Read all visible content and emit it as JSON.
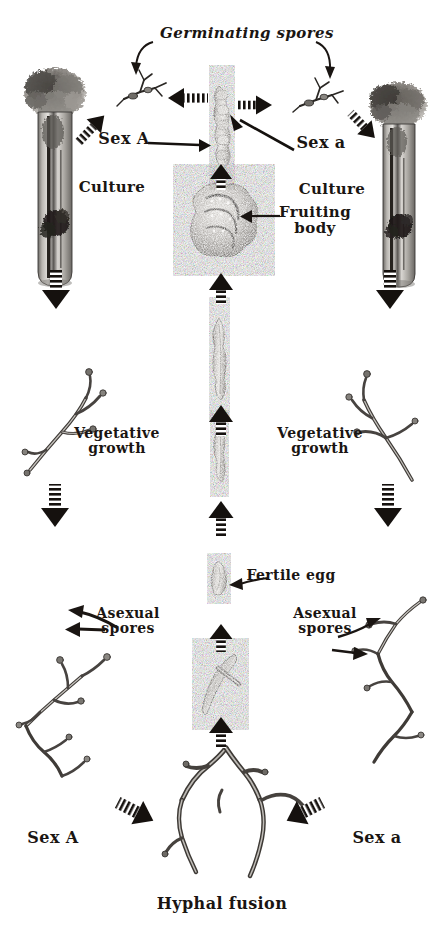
{
  "figure": {
    "background_color": "#ffffff",
    "ink_color": "#1a1512",
    "width": 443,
    "height": 944
  },
  "labels": {
    "germinating_spores": "Germinating spores",
    "sex_a_upper_left": "Sex A",
    "sex_a_upper_right": "Sex a",
    "culture_left": "Culture",
    "culture_right": "Culture",
    "fruiting_body": "Fruiting\nbody",
    "vegetative_growth_left": "Vegetative\ngrowth",
    "vegetative_growth_right": "Vegetative\ngrowth",
    "fertile_egg": "Fertile egg",
    "asexual_spores_left": "Asexual\nspores",
    "asexual_spores_right": "Asexual\nspores",
    "sex_a_lower_left": "Sex A",
    "sex_a_lower_right": "Sex a",
    "hyphal_fusion": "Hyphal fusion"
  },
  "specimens": [
    {
      "name": "culture-tube-left",
      "caption": "Culture"
    },
    {
      "name": "culture-tube-right",
      "caption": "Culture"
    },
    {
      "name": "germinating-spore-left",
      "caption": "Germinating spores"
    },
    {
      "name": "germinating-spore-right",
      "caption": "Germinating spores"
    },
    {
      "name": "spore-chain-center",
      "caption": ""
    },
    {
      "name": "fruiting-body",
      "caption": "Fruiting body"
    },
    {
      "name": "ascus-upper",
      "caption": ""
    },
    {
      "name": "ascus-lower",
      "caption": ""
    },
    {
      "name": "fertile-egg",
      "caption": "Fertile egg"
    },
    {
      "name": "fusing-hypha",
      "caption": ""
    },
    {
      "name": "hyphal-fusion-mycelium",
      "caption": "Hyphal fusion"
    },
    {
      "name": "vegetative-mycelium-left",
      "caption": "Vegetative growth"
    },
    {
      "name": "vegetative-mycelium-right",
      "caption": "Vegetative growth"
    },
    {
      "name": "asexual-spore-mycelium-left",
      "caption": "Asexual spores"
    },
    {
      "name": "asexual-spore-mycelium-right",
      "caption": "Asexual spores"
    }
  ],
  "arrows": [
    {
      "name": "arrow-spore-to-culture-left",
      "style": "striped",
      "direction": "down-left"
    },
    {
      "name": "arrow-chain-to-spore-left",
      "style": "striped",
      "direction": "left"
    },
    {
      "name": "arrow-chain-to-spore-right",
      "style": "striped",
      "direction": "right"
    },
    {
      "name": "arrow-spore-to-culture-right",
      "style": "striped",
      "direction": "down-right"
    },
    {
      "name": "arrow-sexA-to-chain",
      "style": "solid",
      "direction": "right"
    },
    {
      "name": "arrow-sexa-to-chain",
      "style": "solid",
      "direction": "up-left"
    },
    {
      "name": "arrow-fruiting-to-chain",
      "style": "striped",
      "direction": "up"
    },
    {
      "name": "arrow-ascus-to-fruiting",
      "style": "striped",
      "direction": "up"
    },
    {
      "name": "arrow-lower-ascus-to-ascus",
      "style": "striped",
      "direction": "up"
    },
    {
      "name": "arrow-egg-to-ascus",
      "style": "striped",
      "direction": "up"
    },
    {
      "name": "arrow-hypha-to-egg",
      "style": "striped",
      "direction": "up"
    },
    {
      "name": "arrow-fusion-to-hypha",
      "style": "striped",
      "direction": "up"
    },
    {
      "name": "arrow-culture-to-vegetative-left",
      "style": "striped",
      "direction": "down"
    },
    {
      "name": "arrow-culture-to-vegetative-right",
      "style": "striped",
      "direction": "down"
    },
    {
      "name": "arrow-vegetative-to-asexual-left",
      "style": "striped",
      "direction": "down"
    },
    {
      "name": "arrow-vegetative-to-asexual-right",
      "style": "striped",
      "direction": "down"
    },
    {
      "name": "arrow-sexA-to-fusion",
      "style": "striped",
      "direction": "down-right"
    },
    {
      "name": "arrow-sexa-to-fusion",
      "style": "striped",
      "direction": "down-left"
    },
    {
      "name": "leader-germinating-left",
      "style": "curve",
      "direction": "down-left"
    },
    {
      "name": "leader-germinating-right",
      "style": "curve",
      "direction": "down-right"
    },
    {
      "name": "leader-fruiting-body",
      "style": "solid",
      "direction": "left"
    },
    {
      "name": "leader-fertile-egg",
      "style": "solid",
      "direction": "left"
    },
    {
      "name": "leader-vegetative-left",
      "style": "solid",
      "direction": "up-left"
    },
    {
      "name": "leader-vegetative-right",
      "style": "solid",
      "direction": "up-right"
    },
    {
      "name": "leader-asexual-left",
      "style": "solid",
      "direction": "left"
    },
    {
      "name": "leader-asexual-right",
      "style": "solid",
      "direction": "right"
    }
  ]
}
